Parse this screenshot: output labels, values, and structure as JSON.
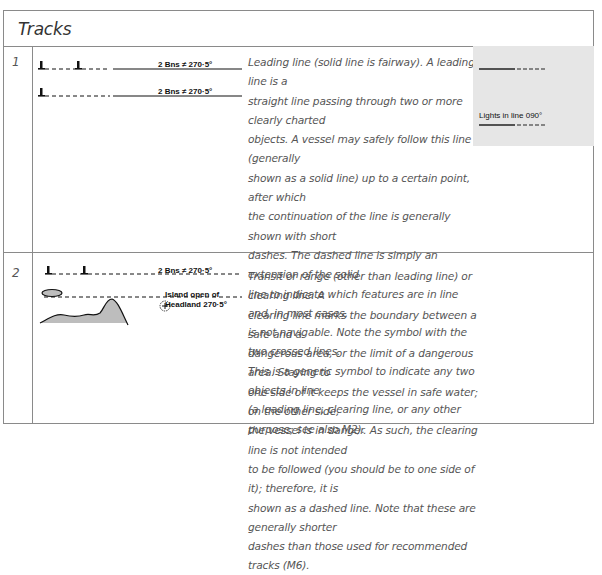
{
  "header": {
    "title": "Tracks"
  },
  "rows": [
    {
      "number": "1",
      "symbol_labels": [
        "2 Bns ≠ 270·5°",
        "2 Bns ≠ 270·5°"
      ],
      "illustration_label": "Lights in line 090°",
      "description_lines": [
        "Leading line (solid line is fairway). A leading line is a",
        "straight line passing through two or more clearly charted",
        "objects. A vessel may safely follow this line (generally",
        "shown as a solid line) up to a certain point, after which",
        "the continuation of the line is generally shown with short",
        "dashes. The dashed line is simply an extension of the solid",
        "line to indicate which features are in line and, in most cases,",
        "is not navigable. Note the symbol with the two crossed lines.",
        "This is a generic symbol to indicate any two objects in line",
        "(a leading line, clearing line, or any other purpose; see also M2)."
      ]
    },
    {
      "number": "2",
      "symbol_labels": [
        "2 Bns ≠ 270·5°",
        "Island open of",
        "Headland 270·5°"
      ],
      "description_lines": [
        "Transit or range (other than leading line) or clearing line. A",
        "clearing line marks the boundary between a safe and a",
        "dangerous area, or the limit of a dangerous area. Staying to",
        "one side of it keeps the vessel in safe water; on the other side,",
        "the vessel is in danger. As such, the clearing line is not intended",
        "to be followed (you should be to one side of it); therefore, it is",
        "shown as a dashed line. Note that these are generally shorter",
        "dashes than those used for recommended tracks (M6)."
      ]
    }
  ],
  "colors": {
    "border": "#8a8a8a",
    "illustration_bg": "#e6e6e6",
    "land_fill": "#bdbdbd"
  }
}
